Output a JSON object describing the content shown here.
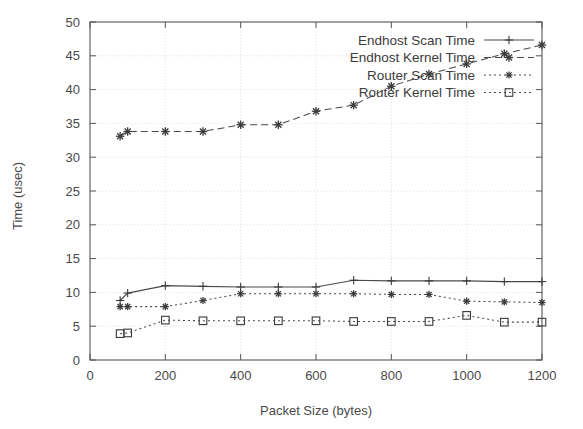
{
  "chart_data": {
    "type": "line",
    "title": "",
    "xlabel": "Packet Size (bytes)",
    "ylabel": "Time (usec)",
    "xlim": [
      0,
      1200
    ],
    "ylim": [
      0,
      50
    ],
    "xticks": [
      0,
      200,
      400,
      600,
      800,
      1000,
      1200
    ],
    "yticks": [
      0,
      5,
      10,
      15,
      20,
      25,
      30,
      35,
      40,
      45,
      50
    ],
    "grid": true,
    "legend_position": "top-right",
    "series": [
      {
        "name": "Endhost Scan Time",
        "marker": "plus",
        "linestyle": "solid",
        "x": [
          80,
          100,
          200,
          300,
          400,
          500,
          600,
          700,
          800,
          900,
          1000,
          1100,
          1200
        ],
        "y": [
          8.8,
          9.9,
          11.0,
          10.9,
          10.8,
          10.8,
          10.8,
          11.8,
          11.7,
          11.7,
          11.7,
          11.6,
          11.6
        ]
      },
      {
        "name": "Endhost Kernel Time",
        "marker": "star",
        "linestyle": "dashed",
        "x": [
          80,
          100,
          200,
          300,
          400,
          500,
          600,
          700,
          800,
          900,
          1000,
          1100,
          1200
        ],
        "y": [
          33.1,
          33.8,
          33.8,
          33.8,
          34.8,
          34.8,
          36.8,
          37.7,
          40.5,
          42.3,
          43.8,
          45.3,
          46.6
        ]
      },
      {
        "name": "Router Scan Time",
        "marker": "star-small",
        "linestyle": "dotted",
        "x": [
          80,
          100,
          200,
          300,
          400,
          500,
          600,
          700,
          800,
          900,
          1000,
          1100,
          1200
        ],
        "y": [
          7.9,
          7.9,
          7.9,
          8.8,
          9.8,
          9.8,
          9.8,
          9.8,
          9.7,
          9.7,
          8.7,
          8.6,
          8.5
        ]
      },
      {
        "name": "Router Kernel Time",
        "marker": "square",
        "linestyle": "dotted",
        "x": [
          80,
          100,
          200,
          300,
          400,
          500,
          600,
          700,
          800,
          900,
          1000,
          1100,
          1200
        ],
        "y": [
          3.9,
          4.0,
          5.9,
          5.8,
          5.8,
          5.8,
          5.8,
          5.7,
          5.7,
          5.7,
          6.6,
          5.6,
          5.6
        ]
      }
    ]
  },
  "colors": {
    "ink": "#4a4a4a",
    "grid": "#c9c9c9",
    "background": "#ffffff"
  }
}
